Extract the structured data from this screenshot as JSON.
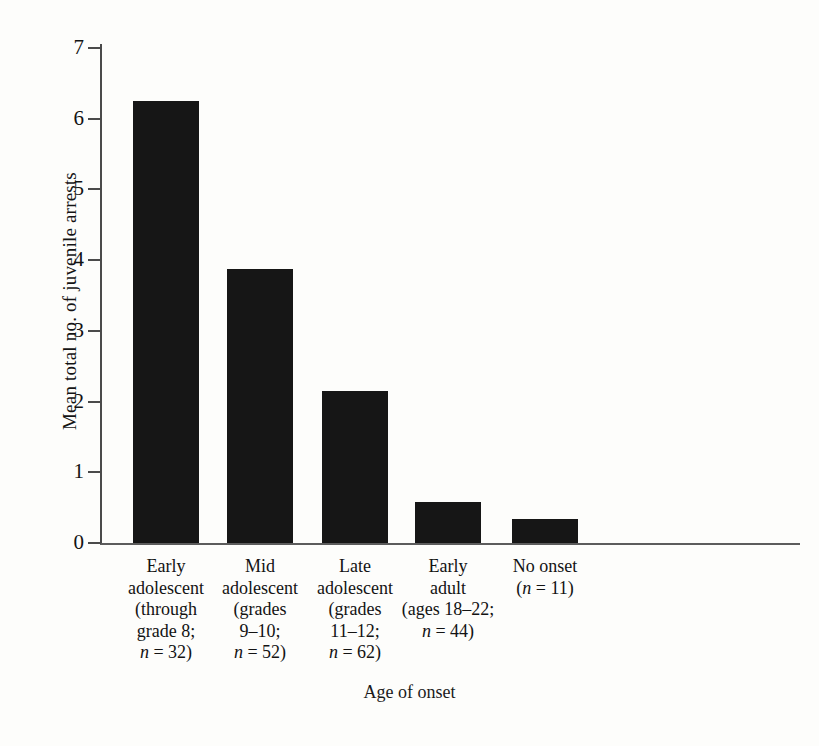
{
  "chart_data": {
    "type": "bar",
    "title": "",
    "xlabel": "Age of onset",
    "ylabel": "Mean total no. of juvenile arrests",
    "categories": [
      "Early adolescent (through grade 8; n = 32)",
      "Mid adolescent (grades 9–10; n = 52)",
      "Late adolescent (grades 11–12; n = 62)",
      "Early adult (ages 18–22; n = 44)",
      "No onset (n = 11)"
    ],
    "values": [
      6.25,
      3.87,
      2.15,
      0.58,
      0.34
    ],
    "ylim": [
      0,
      7
    ],
    "yticks": [
      "0",
      "1",
      "2",
      "3",
      "4",
      "5",
      "6",
      "7"
    ],
    "grid": false,
    "legend": "none",
    "bar_color": "#161616",
    "axis_color": "#4a4a4a",
    "background": "#fdfdfb"
  },
  "axes": {
    "y_title": "Mean total no. of juvenile arrests",
    "x_title": "Age of onset"
  },
  "category_labels": [
    {
      "lines": [
        {
          "text": "Early"
        },
        {
          "text": "adolescent"
        },
        {
          "text": "(through"
        },
        {
          "text": "grade 8;"
        }
      ],
      "n_prefix": "n",
      "n_value": " = 32)"
    },
    {
      "lines": [
        {
          "text": "Mid"
        },
        {
          "text": "adolescent"
        },
        {
          "text": "(grades"
        },
        {
          "text": "9–10;"
        }
      ],
      "n_prefix": "n",
      "n_value": " = 52)"
    },
    {
      "lines": [
        {
          "text": "Late"
        },
        {
          "text": "adolescent"
        },
        {
          "text": "(grades"
        },
        {
          "text": "11–12;"
        }
      ],
      "n_prefix": "n",
      "n_value": " = 62)"
    },
    {
      "lines": [
        {
          "text": "Early"
        },
        {
          "text": "adult"
        },
        {
          "text": "(ages 18–22;"
        }
      ],
      "n_prefix": "n",
      "n_value": " = 44)"
    },
    {
      "lines": [
        {
          "text": "No onset"
        }
      ],
      "n_prefix": "n",
      "n_value": " = 11)",
      "n_open_paren": "(",
      "n_inline": true
    }
  ]
}
